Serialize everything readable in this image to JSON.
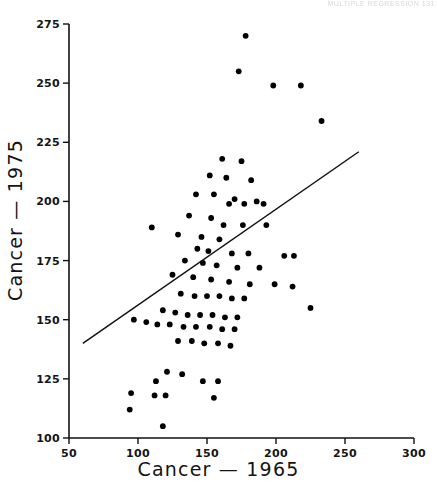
{
  "page": {
    "header_text": "MULTIPLE REGRESSION    131"
  },
  "chart_data": {
    "type": "scatter",
    "title": "",
    "xlabel": "Cancer — 1965",
    "ylabel": "Cancer — 1975",
    "xlim": [
      50,
      300
    ],
    "ylim": [
      100,
      275
    ],
    "xticks": [
      50,
      100,
      150,
      200,
      250,
      300
    ],
    "yticks": [
      100,
      125,
      150,
      175,
      200,
      225,
      250,
      275
    ],
    "grid": false,
    "legend": null,
    "marker": {
      "shape": "circle",
      "color": "#000000",
      "size_px": 5
    },
    "series": [
      {
        "name": "States",
        "points": [
          [
            178,
            270
          ],
          [
            173,
            255
          ],
          [
            198,
            249
          ],
          [
            218,
            249
          ],
          [
            233,
            234
          ],
          [
            161,
            218
          ],
          [
            175,
            217
          ],
          [
            152,
            211
          ],
          [
            164,
            210
          ],
          [
            182,
            209
          ],
          [
            142,
            203
          ],
          [
            155,
            203
          ],
          [
            170,
            201
          ],
          [
            186,
            200
          ],
          [
            166,
            199
          ],
          [
            177,
            199
          ],
          [
            191,
            199
          ],
          [
            137,
            194
          ],
          [
            153,
            193
          ],
          [
            110,
            189
          ],
          [
            162,
            190
          ],
          [
            176,
            190
          ],
          [
            193,
            190
          ],
          [
            129,
            186
          ],
          [
            146,
            185
          ],
          [
            159,
            184
          ],
          [
            143,
            180
          ],
          [
            151,
            179
          ],
          [
            168,
            178
          ],
          [
            180,
            178
          ],
          [
            206,
            177
          ],
          [
            213,
            177
          ],
          [
            134,
            175
          ],
          [
            147,
            174
          ],
          [
            157,
            173
          ],
          [
            172,
            172
          ],
          [
            188,
            172
          ],
          [
            125,
            169
          ],
          [
            140,
            168
          ],
          [
            153,
            167
          ],
          [
            166,
            166
          ],
          [
            181,
            165
          ],
          [
            199,
            165
          ],
          [
            212,
            164
          ],
          [
            131,
            161
          ],
          [
            141,
            160
          ],
          [
            150,
            160
          ],
          [
            159,
            160
          ],
          [
            168,
            159
          ],
          [
            177,
            159
          ],
          [
            225,
            155
          ],
          [
            118,
            154
          ],
          [
            127,
            153
          ],
          [
            136,
            152
          ],
          [
            145,
            152
          ],
          [
            154,
            152
          ],
          [
            163,
            151
          ],
          [
            172,
            151
          ],
          [
            97,
            150
          ],
          [
            106,
            149
          ],
          [
            114,
            148
          ],
          [
            123,
            148
          ],
          [
            133,
            147
          ],
          [
            142,
            147
          ],
          [
            152,
            147
          ],
          [
            161,
            146
          ],
          [
            170,
            146
          ],
          [
            129,
            141
          ],
          [
            139,
            141
          ],
          [
            148,
            140
          ],
          [
            158,
            140
          ],
          [
            167,
            139
          ],
          [
            121,
            128
          ],
          [
            132,
            127
          ],
          [
            113,
            124
          ],
          [
            147,
            124
          ],
          [
            158,
            124
          ],
          [
            95,
            119
          ],
          [
            120,
            118
          ],
          [
            112,
            118
          ],
          [
            155,
            117
          ],
          [
            94,
            112
          ],
          [
            118,
            105
          ]
        ]
      }
    ],
    "fit_line": {
      "name": "regression line",
      "x1": 60,
      "y1": 140,
      "x2": 260,
      "y2": 221
    }
  }
}
